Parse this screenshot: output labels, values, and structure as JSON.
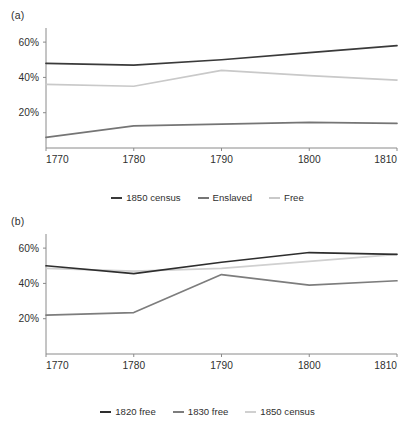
{
  "figure": {
    "panels": [
      {
        "label": "(a)",
        "chart_data": {
          "type": "line",
          "title": "",
          "xlabel": "",
          "ylabel": "",
          "x": [
            1770,
            1780,
            1790,
            1800,
            1810
          ],
          "xticklabels": [
            "1770",
            "1780",
            "1790",
            "1800",
            "1810"
          ],
          "yticks": [
            20,
            40,
            60
          ],
          "yticklabels": [
            "20%",
            "40%",
            "60%"
          ],
          "ylim": [
            0,
            68
          ],
          "xlim": [
            1770,
            1810
          ],
          "grid": false,
          "legend_position": "bottom",
          "series": [
            {
              "name": "1850 census",
              "color": "#3a3a3a",
              "values": [
                48,
                47,
                50,
                54,
                58
              ]
            },
            {
              "name": "Enslaved",
              "color": "#757575",
              "values": [
                6,
                12.5,
                13.5,
                14.5,
                14
              ]
            },
            {
              "name": "Free",
              "color": "#c9c9c9",
              "values": [
                36,
                35,
                44,
                41,
                38.5
              ]
            }
          ]
        }
      },
      {
        "label": "(b)",
        "chart_data": {
          "type": "line",
          "title": "",
          "xlabel": "",
          "ylabel": "",
          "x": [
            1770,
            1780,
            1790,
            1800,
            1810
          ],
          "xticklabels": [
            "1770",
            "1780",
            "1790",
            "1800",
            "1810"
          ],
          "yticks": [
            20,
            40,
            60
          ],
          "yticklabels": [
            "20%",
            "40%",
            "60%"
          ],
          "ylim": [
            0,
            68
          ],
          "xlim": [
            1770,
            1810
          ],
          "grid": false,
          "legend_position": "bottom",
          "series": [
            {
              "name": "1820 free",
              "color": "#2e2e2e",
              "values": [
                50,
                45.5,
                52,
                57.5,
                56.5
              ]
            },
            {
              "name": "1830 free",
              "color": "#7d7d7d",
              "values": [
                22,
                23.5,
                45,
                39,
                41.5
              ]
            },
            {
              "name": "1850 census",
              "color": "#d0d0d0",
              "values": [
                48.5,
                47,
                48.5,
                52.5,
                56.5
              ]
            }
          ]
        }
      }
    ]
  }
}
